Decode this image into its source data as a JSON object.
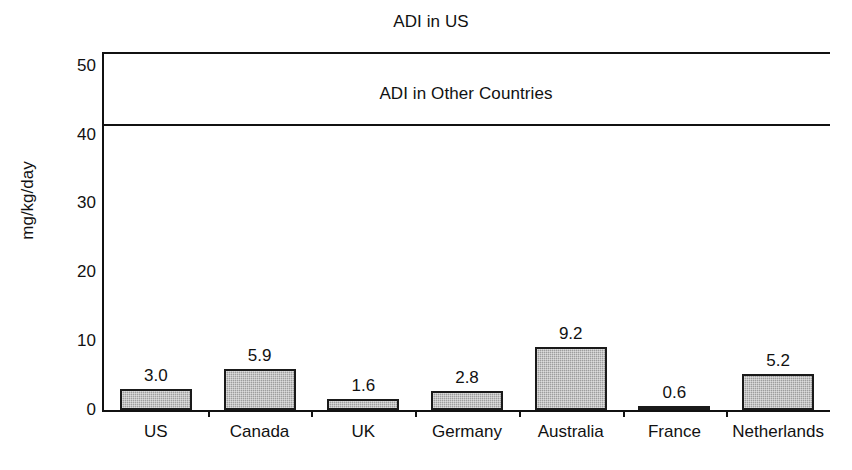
{
  "chart_data": {
    "type": "bar",
    "title": "",
    "xlabel": "",
    "ylabel": "mg/kg/day",
    "ylim": [
      0,
      52
    ],
    "yticks": [
      0,
      10,
      20,
      30,
      40,
      50
    ],
    "ytick_labels": [
      "0",
      "10",
      "20",
      "30",
      "40",
      "50"
    ],
    "grid": false,
    "legend": "none",
    "categories": [
      "US",
      "Canada",
      "UK",
      "Germany",
      "Australia",
      "France",
      "Netherlands"
    ],
    "values": [
      3.0,
      5.9,
      1.6,
      2.8,
      9.2,
      0.6,
      5.2
    ],
    "value_labels": [
      "3.0",
      "5.9",
      "1.6",
      "2.8",
      "9.2",
      "0.6",
      "5.2"
    ],
    "bar_color": "#9d9d9d",
    "bar_edge_color": "#1a1a1a",
    "annotations": [
      {
        "text": "ADI in US",
        "value": 51,
        "position": "above-line"
      },
      {
        "text": "ADI in Other Countries",
        "value": 41,
        "position": "above-line"
      }
    ],
    "reference_lines": [
      {
        "label": "ADI in US",
        "value": 51
      },
      {
        "label": "ADI in Other Countries",
        "value": 41
      }
    ]
  },
  "axis": {
    "y_title": "mg/kg/day",
    "y_ticks": [
      "50",
      "40",
      "30",
      "20",
      "10",
      "0"
    ]
  },
  "annotations": {
    "adi_us": "ADI in US",
    "adi_other": "ADI in Other Countries"
  }
}
